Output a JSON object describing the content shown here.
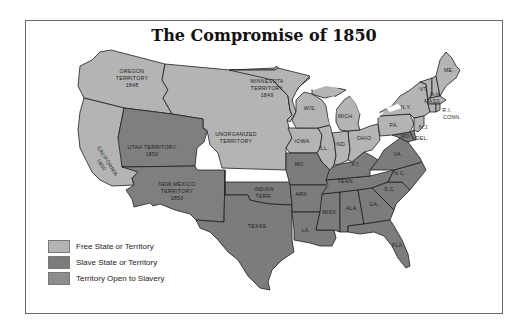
{
  "title": "The Compromise of 1850",
  "colors": {
    "free": "#b4b4b4",
    "slave": "#7c7c7c",
    "open": "#8d8d8d",
    "border": "#1e1e1e",
    "frame": "#6a6a6a"
  },
  "legend": [
    {
      "label": "Free State or Territory",
      "category": "free"
    },
    {
      "label": "Slave State or Territory",
      "category": "slave"
    },
    {
      "label": "Territory Open to Slavery",
      "category": "open"
    }
  ],
  "regions": [
    {
      "label": "OREGON TERRITORY 1848",
      "category": "free"
    },
    {
      "label": "MINNESOTA TERRITORY 1849",
      "category": "free"
    },
    {
      "label": "UNORGANIZED TERRITORY",
      "category": "free"
    },
    {
      "label": "CALIFORNIA 1850",
      "category": "free"
    },
    {
      "label": "UTAH TERRITORY 1850",
      "category": "open"
    },
    {
      "label": "NEW MEXICO TERRITORY 1850",
      "category": "open"
    },
    {
      "label": "WIS.",
      "category": "free"
    },
    {
      "label": "MICH.",
      "category": "free"
    },
    {
      "label": "IOWA",
      "category": "free"
    },
    {
      "label": "ILL.",
      "category": "free"
    },
    {
      "label": "IND.",
      "category": "free"
    },
    {
      "label": "OHIO",
      "category": "free"
    },
    {
      "label": "PA.",
      "category": "free"
    },
    {
      "label": "N.Y.",
      "category": "free"
    },
    {
      "label": "VT.",
      "category": "free"
    },
    {
      "label": "N.H.",
      "category": "free"
    },
    {
      "label": "ME.",
      "category": "free"
    },
    {
      "label": "MASS.",
      "category": "free"
    },
    {
      "label": "R.I.",
      "category": "free"
    },
    {
      "label": "CONN.",
      "category": "free"
    },
    {
      "label": "N.J.",
      "category": "free"
    },
    {
      "label": "DEL.",
      "category": "slave"
    },
    {
      "label": "MD.",
      "category": "slave"
    },
    {
      "label": "VA.",
      "category": "slave"
    },
    {
      "label": "KY.",
      "category": "slave"
    },
    {
      "label": "MO.",
      "category": "slave"
    },
    {
      "label": "TENN.",
      "category": "slave"
    },
    {
      "label": "N.C.",
      "category": "slave"
    },
    {
      "label": "S.C.",
      "category": "slave"
    },
    {
      "label": "GA.",
      "category": "slave"
    },
    {
      "label": "ALA.",
      "category": "slave"
    },
    {
      "label": "MISS.",
      "category": "slave"
    },
    {
      "label": "LA.",
      "category": "slave"
    },
    {
      "label": "ARK.",
      "category": "slave"
    },
    {
      "label": "TEXAS",
      "category": "slave"
    },
    {
      "label": "FLA.",
      "category": "slave"
    },
    {
      "label": "INDIAN TERR.",
      "category": "slave"
    }
  ],
  "labels": {
    "oregon": [
      "OREGON",
      "TERRITORY",
      "1848"
    ],
    "minnesota": [
      "MINNESOTA",
      "TERRITORY",
      "1849"
    ],
    "unorganized": [
      "UNORGANIZED",
      "TERRITORY"
    ],
    "utah": [
      "UTAH TERRITORY",
      "1850"
    ],
    "california": [
      "CALIFORNIA",
      "1850"
    ],
    "newmexico": [
      "NEW MEXICO",
      "TERRITORY",
      "1850"
    ],
    "indian": [
      "INDIAN",
      "TERR."
    ],
    "wis": "WIS.",
    "mich": "MICH.",
    "iowa": "IOWA",
    "ill": "ILL.",
    "ind": "IND.",
    "ohio": "OHIO",
    "pa": "PA.",
    "ny": "N.Y.",
    "vt": "VT.",
    "nh": "N.H.",
    "me": "ME.",
    "mass": "MASS.",
    "ri": "R.I.",
    "conn": "CONN.",
    "nj": "N.J.",
    "del": "DEL.",
    "md": "MD.",
    "va": "VA.",
    "ky": "KY.",
    "mo": "MO.",
    "tenn": "TENN.",
    "nc": "N.C.",
    "sc": "S.C.",
    "ga": "GA.",
    "ala": "ALA.",
    "miss": "MISS.",
    "la": "LA.",
    "ark": "ARK.",
    "texas": "TEXAS",
    "fla": "FLA."
  }
}
